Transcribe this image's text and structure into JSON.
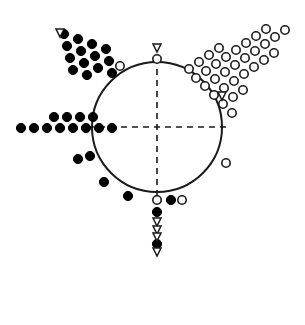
{
  "figure": {
    "title": "",
    "header_artifact": "",
    "background_color": "#ffffff",
    "stroke_color": "#1a1a1a",
    "fill_color": "#000000",
    "width": 305,
    "height": 325
  },
  "chart_data": {
    "type": "scatter",
    "title": "",
    "subtitle": "",
    "xlabel": "",
    "ylabel": "",
    "projection": "polar",
    "grid": false,
    "legend": null,
    "annotations": [],
    "axes": {
      "center_x": 157,
      "center_y": 127,
      "radius": 65,
      "circle_stroke_width": 2,
      "dashed_axes": [
        {
          "name": "vertical-axis",
          "x1": 157,
          "y1": 58,
          "x2": 157,
          "y2": 196
        },
        {
          "name": "horizontal-axis",
          "x1": 88,
          "y1": 127,
          "x2": 226,
          "y2": 127
        }
      ],
      "dash_pattern": "6 5"
    },
    "marker_styles": {
      "filled_circle": {
        "fill": "#000000",
        "stroke": "#000000",
        "r": 4.6
      },
      "open_circle": {
        "fill": "#ffffff",
        "stroke": "#1a1a1a",
        "r": 4.2,
        "stroke_width": 1.6
      },
      "open_down_triangle": {
        "fill": "#ffffff",
        "stroke": "#1a1a1a",
        "size": 8,
        "stroke_width": 1.5
      }
    },
    "series": [
      {
        "name": "upper-left-arm",
        "marker": "filled_circle",
        "count": 14,
        "points": [
          [
            64,
            34
          ],
          [
            78,
            39
          ],
          [
            92,
            44
          ],
          [
            106,
            49
          ],
          [
            67,
            46
          ],
          [
            81,
            51
          ],
          [
            95,
            56
          ],
          [
            109,
            61
          ],
          [
            70,
            58
          ],
          [
            84,
            63
          ],
          [
            98,
            68
          ],
          [
            112,
            73
          ],
          [
            73,
            70
          ],
          [
            87,
            75
          ]
        ]
      },
      {
        "name": "upper-left-arm-tip-triangle",
        "marker": "open_down_triangle",
        "count": 1,
        "points": [
          [
            60,
            33
          ]
        ]
      },
      {
        "name": "upper-left-arm-open-circle",
        "marker": "open_circle",
        "count": 1,
        "points": [
          [
            120,
            66
          ]
        ]
      },
      {
        "name": "left-arm-lower-row",
        "marker": "filled_circle",
        "count": 8,
        "points": [
          [
            21,
            128
          ],
          [
            34,
            128
          ],
          [
            47,
            128
          ],
          [
            60,
            128
          ],
          [
            73,
            128
          ],
          [
            86,
            128
          ],
          [
            99,
            128
          ],
          [
            112,
            128
          ]
        ]
      },
      {
        "name": "left-arm-upper-row",
        "marker": "filled_circle",
        "count": 4,
        "points": [
          [
            54,
            117
          ],
          [
            67,
            117
          ],
          [
            80,
            117
          ],
          [
            93,
            117
          ]
        ]
      },
      {
        "name": "lower-left-scatter",
        "marker": "filled_circle",
        "count": 4,
        "points": [
          [
            78,
            159
          ],
          [
            90,
            156
          ],
          [
            104,
            182
          ],
          [
            128,
            196
          ]
        ]
      },
      {
        "name": "upper-right-arm-open-circles",
        "marker": "open_circle",
        "count": 33,
        "points": [
          [
            189,
            69
          ],
          [
            199,
            62
          ],
          [
            209,
            55
          ],
          [
            219,
            48
          ],
          [
            196,
            78
          ],
          [
            206,
            71
          ],
          [
            216,
            64
          ],
          [
            226,
            57
          ],
          [
            236,
            50
          ],
          [
            246,
            43
          ],
          [
            256,
            36
          ],
          [
            266,
            29
          ],
          [
            205,
            86
          ],
          [
            215,
            79
          ],
          [
            225,
            72
          ],
          [
            235,
            65
          ],
          [
            245,
            58
          ],
          [
            255,
            51
          ],
          [
            265,
            44
          ],
          [
            275,
            37
          ],
          [
            285,
            30
          ],
          [
            214,
            95
          ],
          [
            224,
            88
          ],
          [
            234,
            81
          ],
          [
            244,
            74
          ],
          [
            254,
            67
          ],
          [
            264,
            60
          ],
          [
            274,
            53
          ],
          [
            223,
            104
          ],
          [
            233,
            97
          ],
          [
            243,
            90
          ],
          [
            232,
            113
          ]
        ]
      },
      {
        "name": "upper-right-arm-base-triangle",
        "marker": "open_down_triangle",
        "count": 1,
        "points": [
          [
            222,
            96
          ]
        ]
      },
      {
        "name": "top-axis-open-circle",
        "marker": "open_circle",
        "count": 1,
        "points": [
          [
            157,
            59
          ]
        ]
      },
      {
        "name": "top-axis-triangle",
        "marker": "open_down_triangle",
        "count": 1,
        "points": [
          [
            157,
            48
          ]
        ]
      },
      {
        "name": "right-side-open-circle",
        "marker": "open_circle",
        "count": 1,
        "points": [
          [
            226,
            163
          ]
        ]
      },
      {
        "name": "bottom-column-open-circles",
        "marker": "open_circle",
        "count": 1,
        "points": [
          [
            157,
            200
          ]
        ]
      },
      {
        "name": "bottom-column-filled",
        "marker": "filled_circle",
        "count": 2,
        "points": [
          [
            157,
            212
          ],
          [
            157,
            244
          ]
        ]
      },
      {
        "name": "bottom-column-triangles",
        "marker": "open_down_triangle",
        "count": 4,
        "points": [
          [
            157,
            222
          ],
          [
            157,
            230
          ],
          [
            157,
            237
          ],
          [
            157,
            252
          ]
        ]
      },
      {
        "name": "bottom-right-pair",
        "marker": "filled_circle",
        "count": 1,
        "points": [
          [
            171,
            200
          ]
        ]
      },
      {
        "name": "bottom-right-open",
        "marker": "open_circle",
        "count": 1,
        "points": [
          [
            182,
            200
          ]
        ]
      }
    ]
  }
}
